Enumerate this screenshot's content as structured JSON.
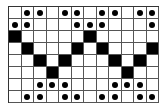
{
  "grid": {
    "rows": 8,
    "cols": 12,
    "colors": {
      "filled": "#000000",
      "empty": "#ffffff",
      "dot": "#000000",
      "line": "#555555"
    },
    "cells": [
      [
        "",
        "dot",
        "dot",
        "",
        "dot",
        "dot",
        "",
        "dot",
        "dot",
        "",
        "dot",
        "dot"
      ],
      [
        "dot",
        "dot",
        "",
        "",
        "",
        "dot",
        "dot",
        "dot",
        "",
        "",
        "",
        "dot"
      ],
      [
        "black",
        "",
        "",
        "",
        "",
        "",
        "black",
        "",
        "",
        "",
        "",
        ""
      ],
      [
        "",
        "black",
        "",
        "",
        "",
        "black",
        "",
        "black",
        "",
        "",
        "",
        "black"
      ],
      [
        "",
        "",
        "black",
        "",
        "black",
        "",
        "",
        "",
        "black",
        "",
        "black",
        ""
      ],
      [
        "",
        "",
        "",
        "black",
        "",
        "",
        "",
        "",
        "",
        "black",
        "",
        ""
      ],
      [
        "",
        "",
        "dot",
        "dot",
        "dot",
        "",
        "",
        "",
        "dot",
        "dot",
        "dot",
        ""
      ],
      [
        "",
        "dot",
        "dot",
        "",
        "dot",
        "dot",
        "",
        "dot",
        "dot",
        "",
        "dot",
        "dot"
      ]
    ]
  }
}
